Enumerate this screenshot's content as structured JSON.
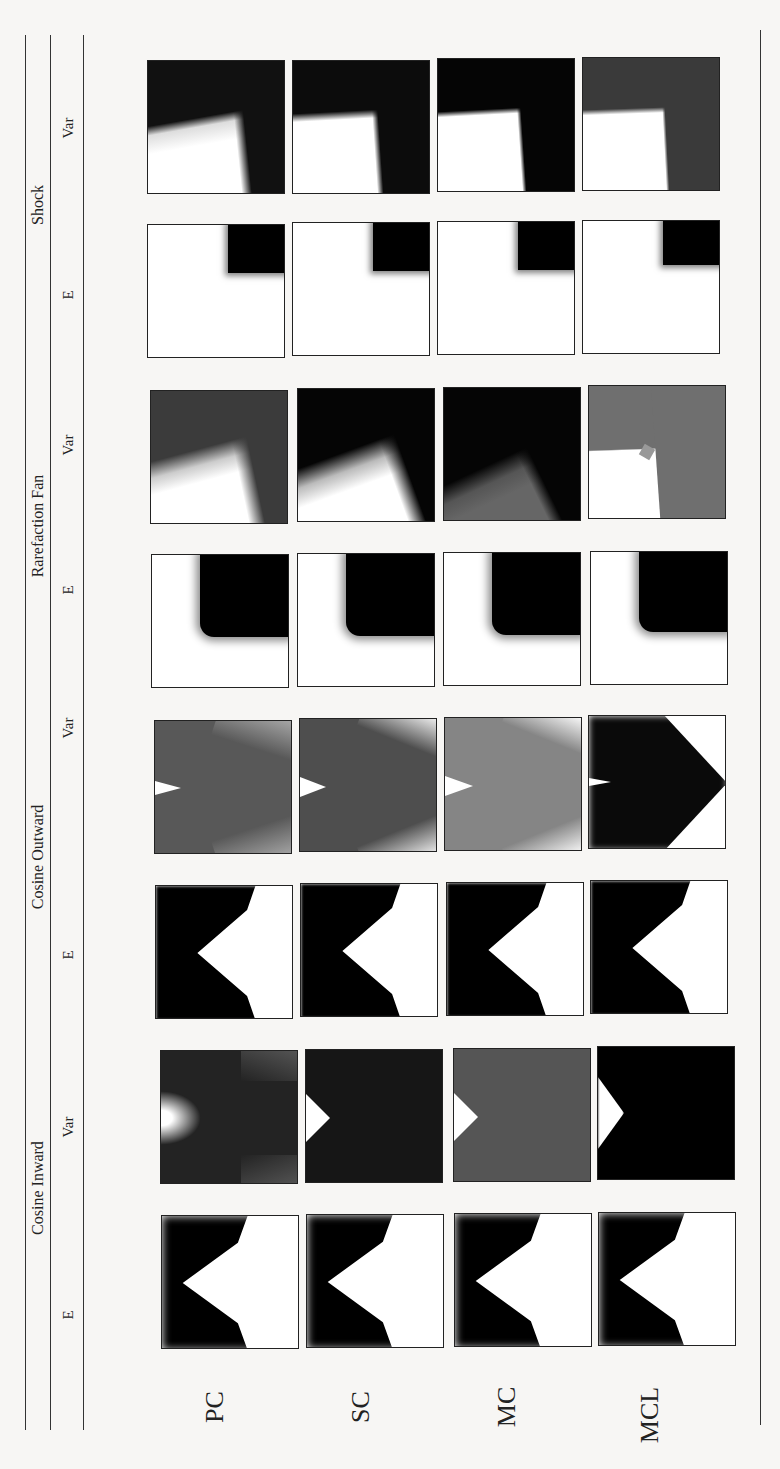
{
  "figure": {
    "orientation": "rotated-90-ccw",
    "column_groups": [
      {
        "label": "Cosine Inward",
        "sub": [
          "E",
          "Var"
        ]
      },
      {
        "label": "Cosine Outward",
        "sub": [
          "E",
          "Var"
        ]
      },
      {
        "label": "Rarefaction Fan",
        "sub": [
          "E",
          "Var"
        ]
      },
      {
        "label": "Shock",
        "sub": [
          "E",
          "Var"
        ]
      }
    ],
    "rows": [
      "PC",
      "SC",
      "MC",
      "MCL"
    ],
    "cells": {
      "shock_var": {
        "PC": "shock-var",
        "SC": "shock-var",
        "MC": "shock-var",
        "MCL": "shock-var"
      },
      "shock_e": {
        "PC": "shock-e",
        "SC": "shock-e",
        "MC": "shock-e",
        "MCL": "shock-e"
      }
    }
  }
}
